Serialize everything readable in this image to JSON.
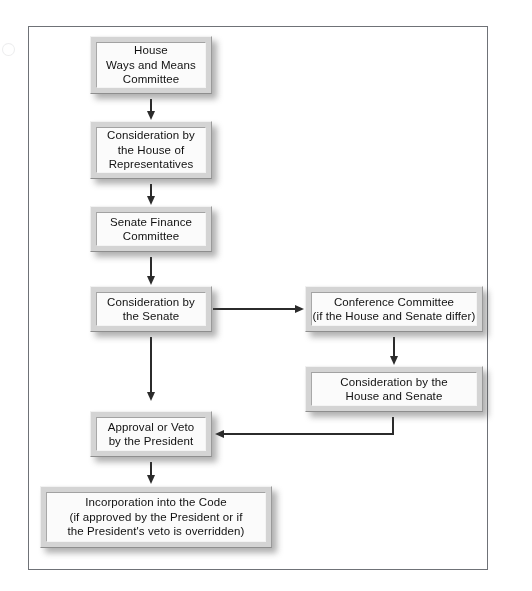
{
  "diagram": {
    "frame": {
      "present": true,
      "border_color": "#6f7277"
    },
    "nodes": [
      {
        "id": "house-ways-and-means-committee",
        "label": "House\nWays and Means\nCommittee",
        "x": 90,
        "y": 36,
        "w": 122,
        "h": 58
      },
      {
        "id": "consideration-house-of-representatives",
        "label": "Consideration by\nthe House of\nRepresentatives",
        "x": 90,
        "y": 121,
        "w": 122,
        "h": 58
      },
      {
        "id": "senate-finance-committee",
        "label": "Senate Finance\nCommittee",
        "x": 90,
        "y": 206,
        "w": 122,
        "h": 46
      },
      {
        "id": "consideration-by-the-senate",
        "label": "Consideration by\nthe Senate",
        "x": 90,
        "y": 286,
        "w": 122,
        "h": 46
      },
      {
        "id": "conference-committee",
        "label": "Conference Committee\n(if the House and Senate differ)",
        "x": 305,
        "y": 286,
        "w": 178,
        "h": 46
      },
      {
        "id": "consideration-house-and-senate",
        "label": "Consideration by the\nHouse and Senate",
        "x": 305,
        "y": 366,
        "w": 178,
        "h": 46
      },
      {
        "id": "approval-or-veto-by-the-president",
        "label": "Approval or Veto\nby the President",
        "x": 90,
        "y": 411,
        "w": 122,
        "h": 46
      },
      {
        "id": "incorporation-into-the-code",
        "label": "Incorporation into the Code\n(if approved by the President or if\nthe President's veto is overridden)",
        "x": 40,
        "y": 486,
        "w": 232,
        "h": 62
      }
    ],
    "connectors": [
      {
        "id": "ways-means-to-house-consideration",
        "type": "vertical-arrow"
      },
      {
        "id": "house-consideration-to-senate-finance",
        "type": "vertical-arrow"
      },
      {
        "id": "senate-finance-to-senate-consideration",
        "type": "vertical-arrow"
      },
      {
        "id": "senate-consideration-to-conference-committee",
        "type": "horizontal-arrow-right"
      },
      {
        "id": "conference-committee-to-house-and-senate",
        "type": "vertical-arrow"
      },
      {
        "id": "house-and-senate-to-approval-or-veto",
        "type": "elbow-arrow-left"
      },
      {
        "id": "senate-consideration-to-approval-or-veto",
        "type": "vertical-arrow"
      },
      {
        "id": "approval-or-veto-to-incorporation",
        "type": "vertical-arrow"
      }
    ]
  }
}
